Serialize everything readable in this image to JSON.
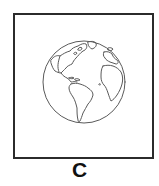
{
  "figure": {
    "label": "C",
    "image_icon": "globe-americas-icon",
    "colors": {
      "frame": "#2b2b2b",
      "globe_stroke": "#5a5a5a",
      "background": "#ffffff"
    }
  }
}
